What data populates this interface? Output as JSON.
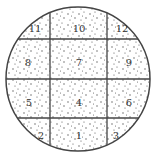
{
  "diagram": {
    "colors": {
      "stroke": "#444444",
      "dots": "#555555",
      "background": "#ffffff"
    },
    "sections": [
      {
        "id": "11",
        "label": "11",
        "x": 35,
        "y": 29
      },
      {
        "id": "10",
        "label": "10",
        "x": 79,
        "y": 29
      },
      {
        "id": "12",
        "label": "12",
        "x": 122,
        "y": 29
      },
      {
        "id": "8",
        "label": "8",
        "x": 28,
        "y": 63
      },
      {
        "id": "7",
        "label": "7",
        "x": 79,
        "y": 63
      },
      {
        "id": "9",
        "label": "9",
        "x": 129,
        "y": 63
      },
      {
        "id": "5",
        "label": "5",
        "x": 29,
        "y": 103
      },
      {
        "id": "4",
        "label": "4",
        "x": 79,
        "y": 103
      },
      {
        "id": "6",
        "label": "6",
        "x": 129,
        "y": 103
      },
      {
        "id": "2",
        "label": "2",
        "x": 41,
        "y": 136
      },
      {
        "id": "1",
        "label": "1",
        "x": 79,
        "y": 136
      },
      {
        "id": "3",
        "label": "3",
        "x": 116,
        "y": 136
      }
    ]
  }
}
